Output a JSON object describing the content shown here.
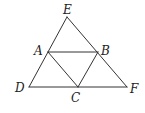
{
  "diagram": {
    "points": {
      "E": {
        "label": "E",
        "x": 67,
        "y": 17,
        "lx": 63,
        "ly": 14
      },
      "A": {
        "label": "A",
        "x": 48,
        "y": 52,
        "lx": 34,
        "ly": 55
      },
      "B": {
        "label": "B",
        "x": 98,
        "y": 52,
        "lx": 101,
        "ly": 55
      },
      "D": {
        "label": "D",
        "x": 29,
        "y": 87,
        "lx": 15,
        "ly": 92
      },
      "C": {
        "label": "C",
        "x": 78,
        "y": 87,
        "lx": 71,
        "ly": 102
      },
      "F": {
        "label": "F",
        "x": 127,
        "y": 87,
        "lx": 130,
        "ly": 93
      }
    },
    "segments": [
      [
        "E",
        "D"
      ],
      [
        "E",
        "F"
      ],
      [
        "D",
        "F"
      ],
      [
        "A",
        "B"
      ],
      [
        "A",
        "C"
      ],
      [
        "B",
        "C"
      ]
    ],
    "stroke_color": "#333333"
  }
}
